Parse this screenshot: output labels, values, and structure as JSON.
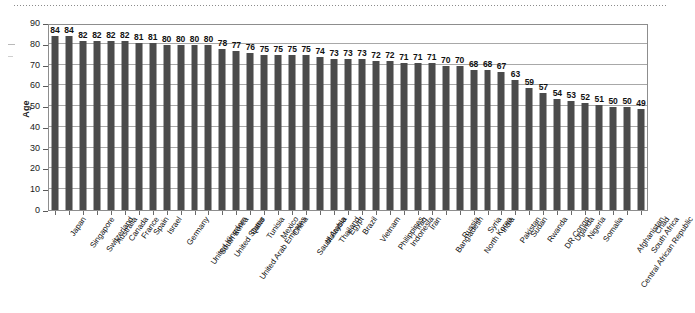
{
  "figure": {
    "background_color": "#ffffff",
    "bar_color": "#4b4b4b",
    "grid_color": "#a8a8a8",
    "axis_color": "#8d8d8d"
  },
  "axes": {
    "y_title": "Age",
    "y_ticks": [
      0,
      10,
      20,
      30,
      40,
      50,
      60,
      70,
      80,
      90
    ],
    "y_min": 0,
    "y_max": 90
  },
  "chart_data": {
    "type": "bar",
    "title": "",
    "xlabel": "",
    "ylabel": "Age",
    "ylim": [
      0,
      90
    ],
    "ytick_step": 10,
    "grid": true,
    "legend": "none",
    "orientation": "vertical",
    "bar_value_labels": true,
    "categories": [
      "Japan",
      "Singapore",
      "Switzerland",
      "Australia",
      "Canada",
      "France",
      "Spain",
      "Israel",
      "Germany",
      "United Kingdom",
      "South Korea",
      "United States",
      "United Arab Emirates",
      "Qatar",
      "Tunisia",
      "Mexico",
      "China",
      "Saudi Arabia",
      "Malaysia",
      "Thailand",
      "Egypt",
      "Brazil",
      "Vietnam",
      "Philippines",
      "Indonesia",
      "Iraq",
      "Iran",
      "Bangladesh",
      "Russia",
      "North Korea",
      "Syria",
      "India",
      "Pakistan",
      "Sudan",
      "Rwanda",
      "DR Congo",
      "Uganda",
      "Nigeria",
      "Somalia",
      "Central African Republic",
      "Afghanistan",
      "South Africa",
      "Chad"
    ],
    "values": [
      84,
      84,
      82,
      82,
      82,
      82,
      81,
      81,
      80,
      80,
      80,
      80,
      78,
      77,
      76,
      75,
      75,
      75,
      75,
      74,
      73,
      73,
      73,
      72,
      72,
      71,
      71,
      71,
      70,
      70,
      68,
      68,
      67,
      63,
      59,
      57,
      54,
      53,
      52,
      51,
      50,
      50,
      49
    ]
  }
}
